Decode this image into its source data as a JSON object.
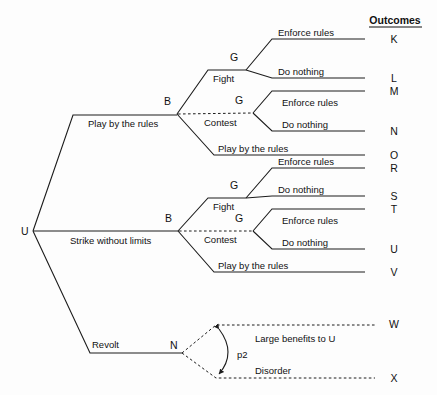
{
  "figure": {
    "kind": "game-tree",
    "outcomes_header": "Outcomes",
    "root": {
      "label": "U",
      "x": 33,
      "y": 231
    },
    "nodes": [
      {
        "id": "root-u",
        "label": "U",
        "x": 33,
        "y": 231,
        "type": "player"
      },
      {
        "id": "b-upper",
        "label": "B",
        "x": 177,
        "y": 114,
        "type": "player"
      },
      {
        "id": "b-lower",
        "label": "B",
        "x": 178,
        "y": 231,
        "type": "player"
      },
      {
        "id": "g-fight-upper",
        "label": "G",
        "x": 246,
        "y": 70,
        "type": "player"
      },
      {
        "id": "g-contest-upper",
        "label": "G",
        "x": 253,
        "y": 113,
        "type": "player"
      },
      {
        "id": "g-fight-lower",
        "label": "G",
        "x": 246,
        "y": 198,
        "type": "player"
      },
      {
        "id": "g-contest-lower",
        "label": "G",
        "x": 253,
        "y": 231,
        "type": "player"
      },
      {
        "id": "n-chance",
        "label": "N",
        "x": 182,
        "y": 353,
        "type": "chance"
      }
    ],
    "edge_labels": {
      "play_by_the_rules": "Play by the rules",
      "strike_without_limits": "Strike without limits",
      "revolt": "Revolt",
      "fight": "Fight",
      "contest": "Contest",
      "enforce_rules": "Enforce rules",
      "do_nothing": "Do nothing",
      "large_benefits": "Large benefits to U",
      "disorder": "Disorder"
    },
    "probability_label": "p2",
    "outcomes": [
      {
        "id": "K",
        "label": "K",
        "y": 39,
        "dashed": false
      },
      {
        "id": "L",
        "label": "L",
        "y": 78,
        "dashed": false
      },
      {
        "id": "M",
        "label": "M",
        "y": 91,
        "dashed": false
      },
      {
        "id": "N",
        "label": "N",
        "y": 131,
        "dashed": false
      },
      {
        "id": "O",
        "label": "O",
        "y": 155,
        "dashed": false
      },
      {
        "id": "R",
        "label": "R",
        "y": 168,
        "dashed": false
      },
      {
        "id": "S",
        "label": "S",
        "y": 196,
        "dashed": false
      },
      {
        "id": "T",
        "label": "T",
        "y": 209,
        "dashed": false
      },
      {
        "id": "U",
        "label": "U",
        "y": 249,
        "dashed": false
      },
      {
        "id": "V",
        "label": "V",
        "y": 272,
        "dashed": false
      },
      {
        "id": "W",
        "label": "W",
        "y": 324,
        "dashed": true
      },
      {
        "id": "X",
        "label": "X",
        "y": 378,
        "dashed": true
      }
    ],
    "branch_text": [
      {
        "id": "bt-play-upper",
        "text": "Play by the rules",
        "x": 88,
        "y": 127
      },
      {
        "id": "bt-strike",
        "text": "Strike without limits",
        "x": 70,
        "y": 244
      },
      {
        "id": "bt-revolt",
        "text": "Revolt",
        "x": 92,
        "y": 348
      },
      {
        "id": "bt-fight-upper",
        "text": "Fight",
        "x": 213,
        "y": 82
      },
      {
        "id": "bt-contest-upper",
        "text": "Contest",
        "x": 204,
        "y": 126
      },
      {
        "id": "bt-play-b-upper",
        "text": "Play by the rules",
        "x": 218,
        "y": 152
      },
      {
        "id": "bt-fight-lower",
        "text": "Fight",
        "x": 213,
        "y": 210
      },
      {
        "id": "bt-contest-lower",
        "text": "Contest",
        "x": 204,
        "y": 243
      },
      {
        "id": "bt-play-b-lower",
        "text": "Play by the rules",
        "x": 218,
        "y": 269
      },
      {
        "id": "bt-enf-1",
        "text": "Enforce rules",
        "x": 278,
        "y": 36
      },
      {
        "id": "bt-don-1",
        "text": "Do nothing",
        "x": 278,
        "y": 75
      },
      {
        "id": "bt-enf-2",
        "text": "Enforce rules",
        "x": 282,
        "y": 106
      },
      {
        "id": "bt-don-2",
        "text": "Do nothing",
        "x": 282,
        "y": 128
      },
      {
        "id": "bt-enf-3",
        "text": "Enforce rules",
        "x": 278,
        "y": 165
      },
      {
        "id": "bt-don-3",
        "text": "Do nothing",
        "x": 278,
        "y": 193
      },
      {
        "id": "bt-enf-4",
        "text": "Enforce rules",
        "x": 282,
        "y": 224
      },
      {
        "id": "bt-don-4",
        "text": "Do nothing",
        "x": 282,
        "y": 246
      },
      {
        "id": "bt-large",
        "text": "Large benefits to U",
        "x": 255,
        "y": 342
      },
      {
        "id": "bt-disorder",
        "text": "Disorder",
        "x": 255,
        "y": 374
      }
    ],
    "colors": {
      "line": "#1c1c1c",
      "text": "#111111",
      "background": "#fdfdfd"
    }
  }
}
